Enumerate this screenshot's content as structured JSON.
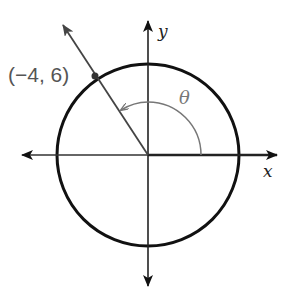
{
  "diagram": {
    "type": "unit-circle-angle",
    "point_label": "(−4, 6)",
    "point": {
      "x": -4,
      "y": 6
    },
    "angle_label": "θ",
    "x_axis_label": "x",
    "y_axis_label": "y",
    "colors": {
      "circle": "#111111",
      "axes": "#222222",
      "ray": "#444444",
      "angle_arc": "#777777",
      "label": "#555555"
    }
  }
}
